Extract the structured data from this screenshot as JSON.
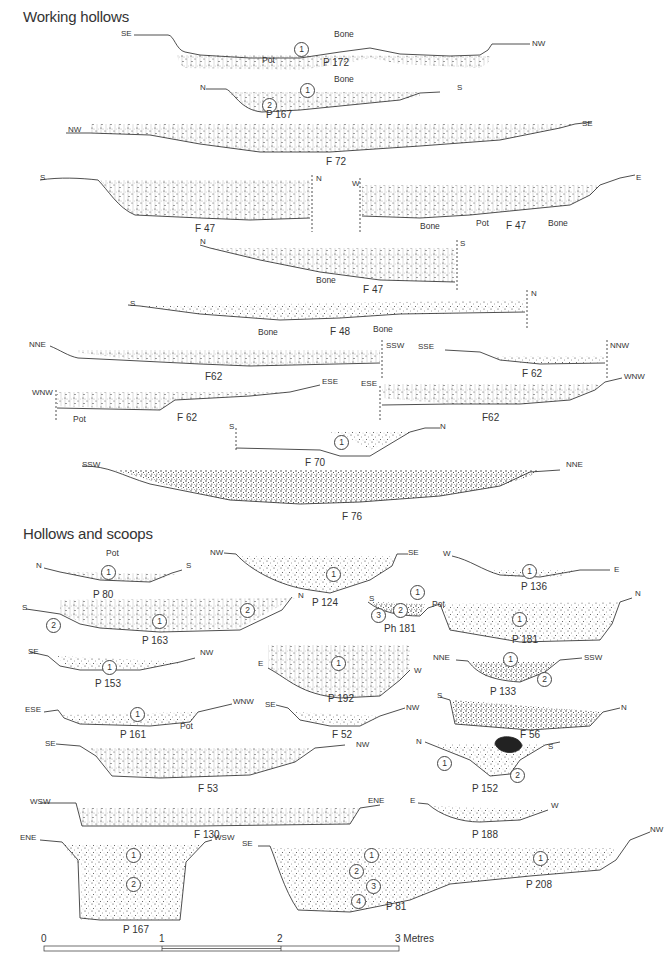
{
  "headings": {
    "working": "Working hollows",
    "hollows": "Hollows and scoops"
  },
  "sections": [
    {
      "id": "P 172",
      "group": "working",
      "left": "SE",
      "right": "NW",
      "contexts": [
        "1"
      ],
      "notes": [
        "Pot",
        "Bone"
      ]
    },
    {
      "id": "P 167",
      "group": "working",
      "left": "N",
      "right": "S",
      "contexts": [
        "1",
        "2"
      ],
      "notes": [
        "Bone"
      ]
    },
    {
      "id": "F 72",
      "group": "working",
      "left": "NW",
      "right": "SE",
      "contexts": [],
      "notes": []
    },
    {
      "id": "F 47",
      "group": "working",
      "left": "S",
      "right": "N",
      "contexts": [],
      "notes": []
    },
    {
      "id": "F 47",
      "group": "working",
      "left": "W",
      "right": "E",
      "contexts": [],
      "notes": [
        "Bone",
        "Pot",
        "Bone"
      ]
    },
    {
      "id": "F 47",
      "group": "working",
      "left": "N",
      "right": "S",
      "contexts": [],
      "notes": [
        "Bone"
      ]
    },
    {
      "id": "F 48",
      "group": "working",
      "left": "S",
      "right": "N",
      "contexts": [],
      "notes": [
        "Bone",
        "Bone"
      ]
    },
    {
      "id": "F62",
      "group": "working",
      "left": "NNE",
      "right": "SSW",
      "contexts": [],
      "notes": []
    },
    {
      "id": "F 62",
      "group": "working",
      "left": "SSE",
      "right": "NNW",
      "contexts": [],
      "notes": []
    },
    {
      "id": "F 62",
      "group": "working",
      "left": "WNW",
      "right": "ESE",
      "contexts": [],
      "notes": [
        "Pot"
      ]
    },
    {
      "id": "F62",
      "group": "working",
      "left": "ESE",
      "right": "WNW",
      "contexts": [],
      "notes": []
    },
    {
      "id": "F 70",
      "group": "working",
      "left": "S",
      "right": "N",
      "contexts": [
        "1"
      ],
      "notes": []
    },
    {
      "id": "F 76",
      "group": "working",
      "left": "SSW",
      "right": "NNE",
      "contexts": [],
      "notes": []
    },
    {
      "id": "P 80",
      "group": "hollows",
      "left": "N",
      "right": "S",
      "contexts": [
        "1"
      ],
      "notes": [
        "Pot"
      ]
    },
    {
      "id": "P 124",
      "group": "hollows",
      "left": "NW",
      "right": "SE",
      "contexts": [
        "1"
      ],
      "notes": []
    },
    {
      "id": "P 136",
      "group": "hollows",
      "left": "W",
      "right": "E",
      "contexts": [
        "1"
      ],
      "notes": []
    },
    {
      "id": "P 163",
      "group": "hollows",
      "left": "S",
      "right": "N",
      "contexts": [
        "2",
        "1",
        "2"
      ],
      "notes": []
    },
    {
      "id": "Ph 181",
      "group": "hollows",
      "left": "S",
      "right": "",
      "contexts": [
        "1",
        "2",
        "3"
      ],
      "notes": [
        "Pot"
      ]
    },
    {
      "id": "P 181",
      "group": "hollows",
      "left": "",
      "right": "N",
      "contexts": [
        "1"
      ],
      "notes": []
    },
    {
      "id": "P 153",
      "group": "hollows",
      "left": "SE",
      "right": "NW",
      "contexts": [
        "1"
      ],
      "notes": []
    },
    {
      "id": "P 192",
      "group": "hollows",
      "left": "E",
      "right": "W",
      "contexts": [
        "1"
      ],
      "notes": []
    },
    {
      "id": "P 133",
      "group": "hollows",
      "left": "NNE",
      "right": "SSW",
      "contexts": [
        "1",
        "2"
      ],
      "notes": []
    },
    {
      "id": "P 161",
      "group": "hollows",
      "left": "ESE",
      "right": "WNW",
      "contexts": [
        "1"
      ],
      "notes": [
        "Pot"
      ]
    },
    {
      "id": "F 52",
      "group": "hollows",
      "left": "SE",
      "right": "NW",
      "contexts": [],
      "notes": []
    },
    {
      "id": "F 56",
      "group": "hollows",
      "left": "S",
      "right": "N",
      "contexts": [],
      "notes": []
    },
    {
      "id": "F 53",
      "group": "hollows",
      "left": "SE",
      "right": "NW",
      "contexts": [],
      "notes": []
    },
    {
      "id": "P 152",
      "group": "hollows",
      "left": "N",
      "right": "S",
      "contexts": [
        "1",
        "2"
      ],
      "notes": []
    },
    {
      "id": "F 130",
      "group": "hollows",
      "left": "WSW",
      "right": "ENE",
      "contexts": [],
      "notes": []
    },
    {
      "id": "P 188",
      "group": "hollows",
      "left": "E",
      "right": "W",
      "contexts": [],
      "notes": []
    },
    {
      "id": "P 167",
      "group": "hollows",
      "left": "ENE",
      "right": "WSW",
      "contexts": [
        "1",
        "2"
      ],
      "notes": []
    },
    {
      "id": "P 81",
      "group": "hollows",
      "left": "SE",
      "right": "",
      "contexts": [
        "1",
        "2",
        "3",
        "4"
      ],
      "notes": []
    },
    {
      "id": "P 208",
      "group": "hollows",
      "left": "",
      "right": "NW",
      "contexts": [
        "1"
      ],
      "notes": []
    }
  ],
  "scale": {
    "ticks": [
      "0",
      "1",
      "2",
      "3 Metres"
    ]
  },
  "colors": {
    "ink": "#222222",
    "paper": "#ffffff"
  }
}
